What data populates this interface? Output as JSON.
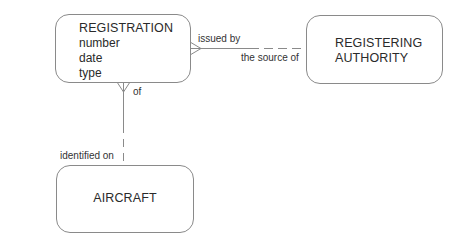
{
  "diagram": {
    "type": "entity-relationship",
    "entities": [
      {
        "id": "registration",
        "name": "REGISTRATION",
        "attributes": [
          "number",
          "date",
          "type"
        ]
      },
      {
        "id": "registering_authority",
        "name_lines": [
          "REGISTERING",
          "AUTHORITY"
        ]
      },
      {
        "id": "aircraft",
        "name": "AIRCRAFT"
      }
    ],
    "relationships": [
      {
        "from": "registration",
        "to": "registering_authority",
        "from_label": "issued by",
        "to_label": "the source of",
        "from_cardinality": "many",
        "to_cardinality": "one",
        "from_optionality": "mandatory",
        "to_optionality": "optional"
      },
      {
        "from": "registration",
        "to": "aircraft",
        "from_label": "of",
        "to_label": "identified on",
        "from_cardinality": "many",
        "to_cardinality": "one",
        "from_optionality": "mandatory",
        "to_optionality": "optional"
      }
    ],
    "colors": {
      "line": "#8a8a8a",
      "text": "#2a2a2a",
      "background": "#ffffff"
    }
  }
}
